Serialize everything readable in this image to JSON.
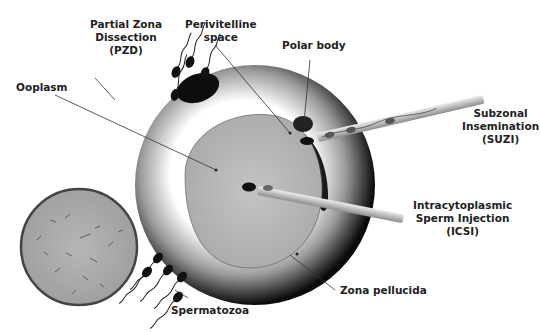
{
  "labels": {
    "pzd": "Partial Zona\nDissection\n(PZD)",
    "perivitelline": "Perivitelline\nspace",
    "polar_body": "Polar body",
    "ooplasm": "Ooplasm",
    "suzi": "Subzonal\nInsemination\n(SUZI)",
    "icsi": "Intracytoplasmic\nSperm Injection\n(ICSI)",
    "zona_pellucida": "Zona pellucida",
    "spermatozoa": "Spermatozoa"
  },
  "colors": {
    "zona_dark": "#111111",
    "zona_light": "#f2f2f2",
    "ooplasm": "#b8b8b8",
    "micrograph": "#a9a9a9",
    "pipette": "#cfcfcf",
    "leader_line": "#333333"
  }
}
